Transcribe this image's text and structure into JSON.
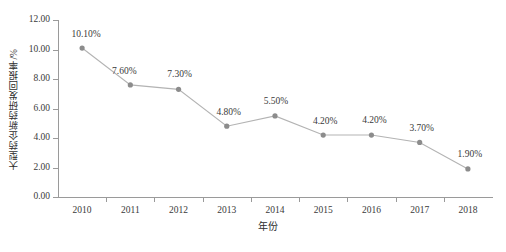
{
  "chart_data": {
    "type": "line",
    "title": "",
    "subtitle": "",
    "xlabel": "年份",
    "ylabel": "大型药企新药研发回报率/%",
    "categories": [
      "2010",
      "2011",
      "2012",
      "2013",
      "2014",
      "2015",
      "2016",
      "2017",
      "2018"
    ],
    "values": [
      10.1,
      7.6,
      7.3,
      4.8,
      5.5,
      4.2,
      4.2,
      3.7,
      1.9
    ],
    "point_labels": [
      "10.10%",
      "7.60%",
      "7.30%",
      "4.80%",
      "5.50%",
      "4.20%",
      "4.20%",
      "3.70%",
      "1.90%"
    ],
    "ylim": [
      0,
      12
    ],
    "ytick_values": [
      0,
      2,
      4,
      6,
      8,
      10,
      12
    ],
    "ytick_labels": [
      "0.00",
      "2.00",
      "4.00",
      "6.00",
      "8.00",
      "10.00",
      "12.00"
    ],
    "grid": false,
    "legend": "none",
    "series": [
      {
        "name": "大型药企新药研发回报率",
        "values": [
          10.1,
          7.6,
          7.3,
          4.8,
          5.5,
          4.2,
          4.2,
          3.7,
          1.9
        ],
        "line_color": "#b3b3b3",
        "marker_color": "#8c8c8c",
        "marker": "circle"
      }
    ],
    "colors": {
      "axis": "#9a9a9a",
      "line": "#b3b3b3",
      "marker": "#8c8c8c",
      "text": "#3a3a3a",
      "background": "#ffffff"
    }
  }
}
